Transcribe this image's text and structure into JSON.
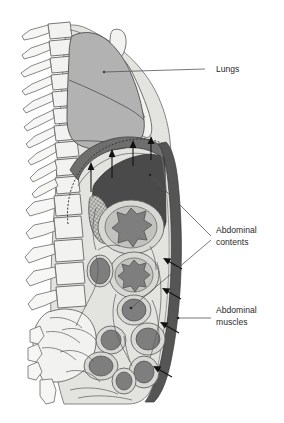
{
  "figure": {
    "background_color": "#ffffff"
  },
  "labels": [
    {
      "id": "lungs",
      "text": "Lungs",
      "name": "label-lungs",
      "x": 218,
      "y": 72,
      "leader": "M205,69 L178,69 M178,69 L104,73"
    },
    {
      "id": "abdominal-contents",
      "line1": "Abdominal",
      "line2": "contents",
      "name": "label-abdominal-contents",
      "x": 218,
      "y": 233,
      "leader_a": "M213,238 L150,175",
      "leader_b": "M213,238 L131,296"
    },
    {
      "id": "abdominal-muscles",
      "line1": "Abdominal",
      "line2": "muscles",
      "name": "label-abdominal-muscles",
      "x": 218,
      "y": 313,
      "leader": "M213,318 L178,318"
    }
  ],
  "colors": {
    "lung_fill": "#b2b2b2",
    "liver_fill": "#4a4a4a",
    "diaphragm_fill": "#6e6e6e",
    "abdominal_wall_fill": "#555555",
    "cavity_fill": "#e3e3e0",
    "bone_fill": "#f2f2f0",
    "gut_outer": "#d8d8d4",
    "gut_inner": "#7e7e7e",
    "label_text": "#2b2b2b",
    "leader_line": "#555555",
    "arrow": "#111111"
  },
  "structures": [
    {
      "name": "vertebral-column",
      "region": "posterior",
      "count": 17
    },
    {
      "name": "sternum",
      "region": "anterior-thorax"
    },
    {
      "name": "lung",
      "region": "thorax"
    },
    {
      "name": "diaphragm",
      "region": "thoraco-abdominal-junction"
    },
    {
      "name": "liver",
      "region": "upper-abdomen"
    },
    {
      "name": "kidney-hatched",
      "region": "posterior-abdomen"
    },
    {
      "name": "intestinal-loops",
      "region": "abdomen",
      "count": 11
    },
    {
      "name": "abdominal-wall-muscles",
      "region": "anterior-abdomen"
    },
    {
      "name": "sacrum-coccyx",
      "region": "pelvis"
    }
  ],
  "arrows": {
    "diaphragm_upward": {
      "name": "diaphragm-upward-arrows",
      "count": 4,
      "direction": "up",
      "points": [
        {
          "x": 91,
          "y": 192,
          "len": 27
        },
        {
          "x": 112,
          "y": 178,
          "len": 26
        },
        {
          "x": 133,
          "y": 166,
          "len": 24
        },
        {
          "x": 151,
          "y": 160,
          "len": 22
        }
      ]
    },
    "abdominal_wall_inward": {
      "name": "abdominal-wall-inward-arrows",
      "count": 4,
      "direction": "left-up",
      "points": [
        {
          "x": 179,
          "y": 263
        },
        {
          "x": 178,
          "y": 293
        },
        {
          "x": 176,
          "y": 327
        },
        {
          "x": 170,
          "y": 371
        }
      ]
    }
  }
}
